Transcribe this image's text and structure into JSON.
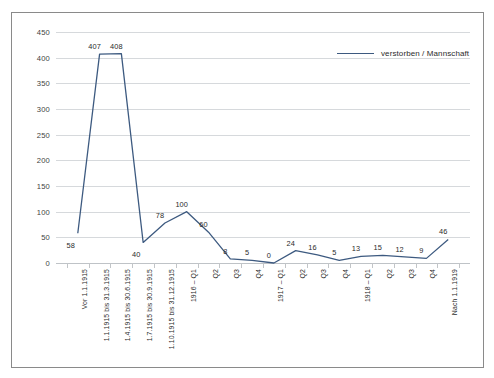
{
  "chart_data": {
    "type": "line",
    "title": "",
    "subtitle": "",
    "xlabel": "",
    "ylabel": "",
    "ylim": [
      0,
      450
    ],
    "yticks": [
      0,
      50,
      100,
      150,
      200,
      250,
      300,
      350,
      400,
      450
    ],
    "grid": true,
    "legend_position": "top-right",
    "legend": [
      "verstorben / Mannschaft"
    ],
    "line_color": "#3d5a80",
    "categories": [
      "Vor 1.1.1915",
      "1.1.1915 bis 31.3.1915",
      "1.4.1915 bis 30.6.1915",
      "1.7.1915 bis 30.9.1915",
      "1.10.1915 bis 31.12.1915",
      "1916 – Q1",
      "Q2",
      "Q3",
      "Q4",
      "1917 – Q1",
      "Q2",
      "Q3",
      "Q4",
      "1918 – Q1",
      "Q2",
      "Q3",
      "Q4",
      "Nach 1.1.1919"
    ],
    "series": [
      {
        "name": "verstorben / Mannschaft",
        "values": [
          58,
          407,
          408,
          40,
          78,
          100,
          60,
          8,
          5,
          0,
          24,
          16,
          5,
          13,
          15,
          12,
          9,
          46
        ]
      }
    ],
    "point_labels": [
      "58",
      "407",
      "408",
      "40",
      "78",
      "100",
      "60",
      "8",
      "5",
      "0",
      "24",
      "16",
      "5",
      "13",
      "15",
      "12",
      "9",
      "46"
    ]
  }
}
